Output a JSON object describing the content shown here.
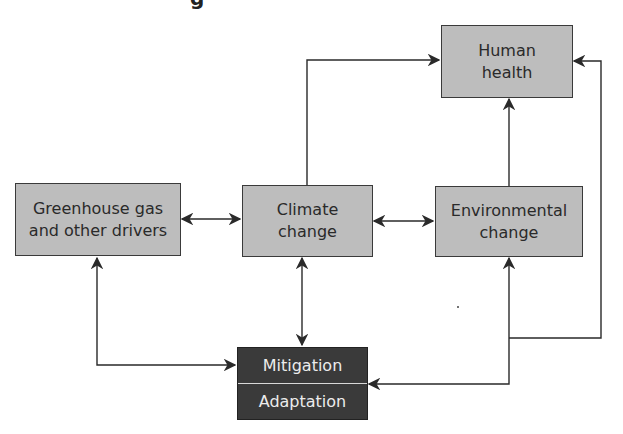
{
  "diagram": {
    "title_fragment": "g",
    "nodes": [
      {
        "id": "human_health",
        "label": "Human\nhealth"
      },
      {
        "id": "greenhouse",
        "label": "Greenhouse gas\nand other drivers"
      },
      {
        "id": "climate",
        "label": "Climate\nchange"
      },
      {
        "id": "environmental",
        "label": "Environmental\nchange"
      },
      {
        "id": "response",
        "label_top": "Mitigation",
        "label_bottom": "Adaptation"
      }
    ],
    "edges": [
      {
        "from": "greenhouse",
        "to": "climate",
        "bidirectional": true
      },
      {
        "from": "climate",
        "to": "environmental",
        "bidirectional": true
      },
      {
        "from": "climate",
        "to": "human_health",
        "bidirectional": false
      },
      {
        "from": "environmental",
        "to": "human_health",
        "bidirectional": false
      },
      {
        "from": "climate",
        "to": "response",
        "bidirectional": true
      },
      {
        "from": "greenhouse",
        "to": "response",
        "bidirectional": true
      },
      {
        "from": "response",
        "to": "environmental",
        "bidirectional": false
      },
      {
        "from": "response",
        "to": "human_health",
        "bidirectional": false
      }
    ],
    "colors": {
      "box_fill": "#bdbdbd",
      "dark_box_fill": "#3a3a3a",
      "line": "#2a2a2a"
    }
  }
}
